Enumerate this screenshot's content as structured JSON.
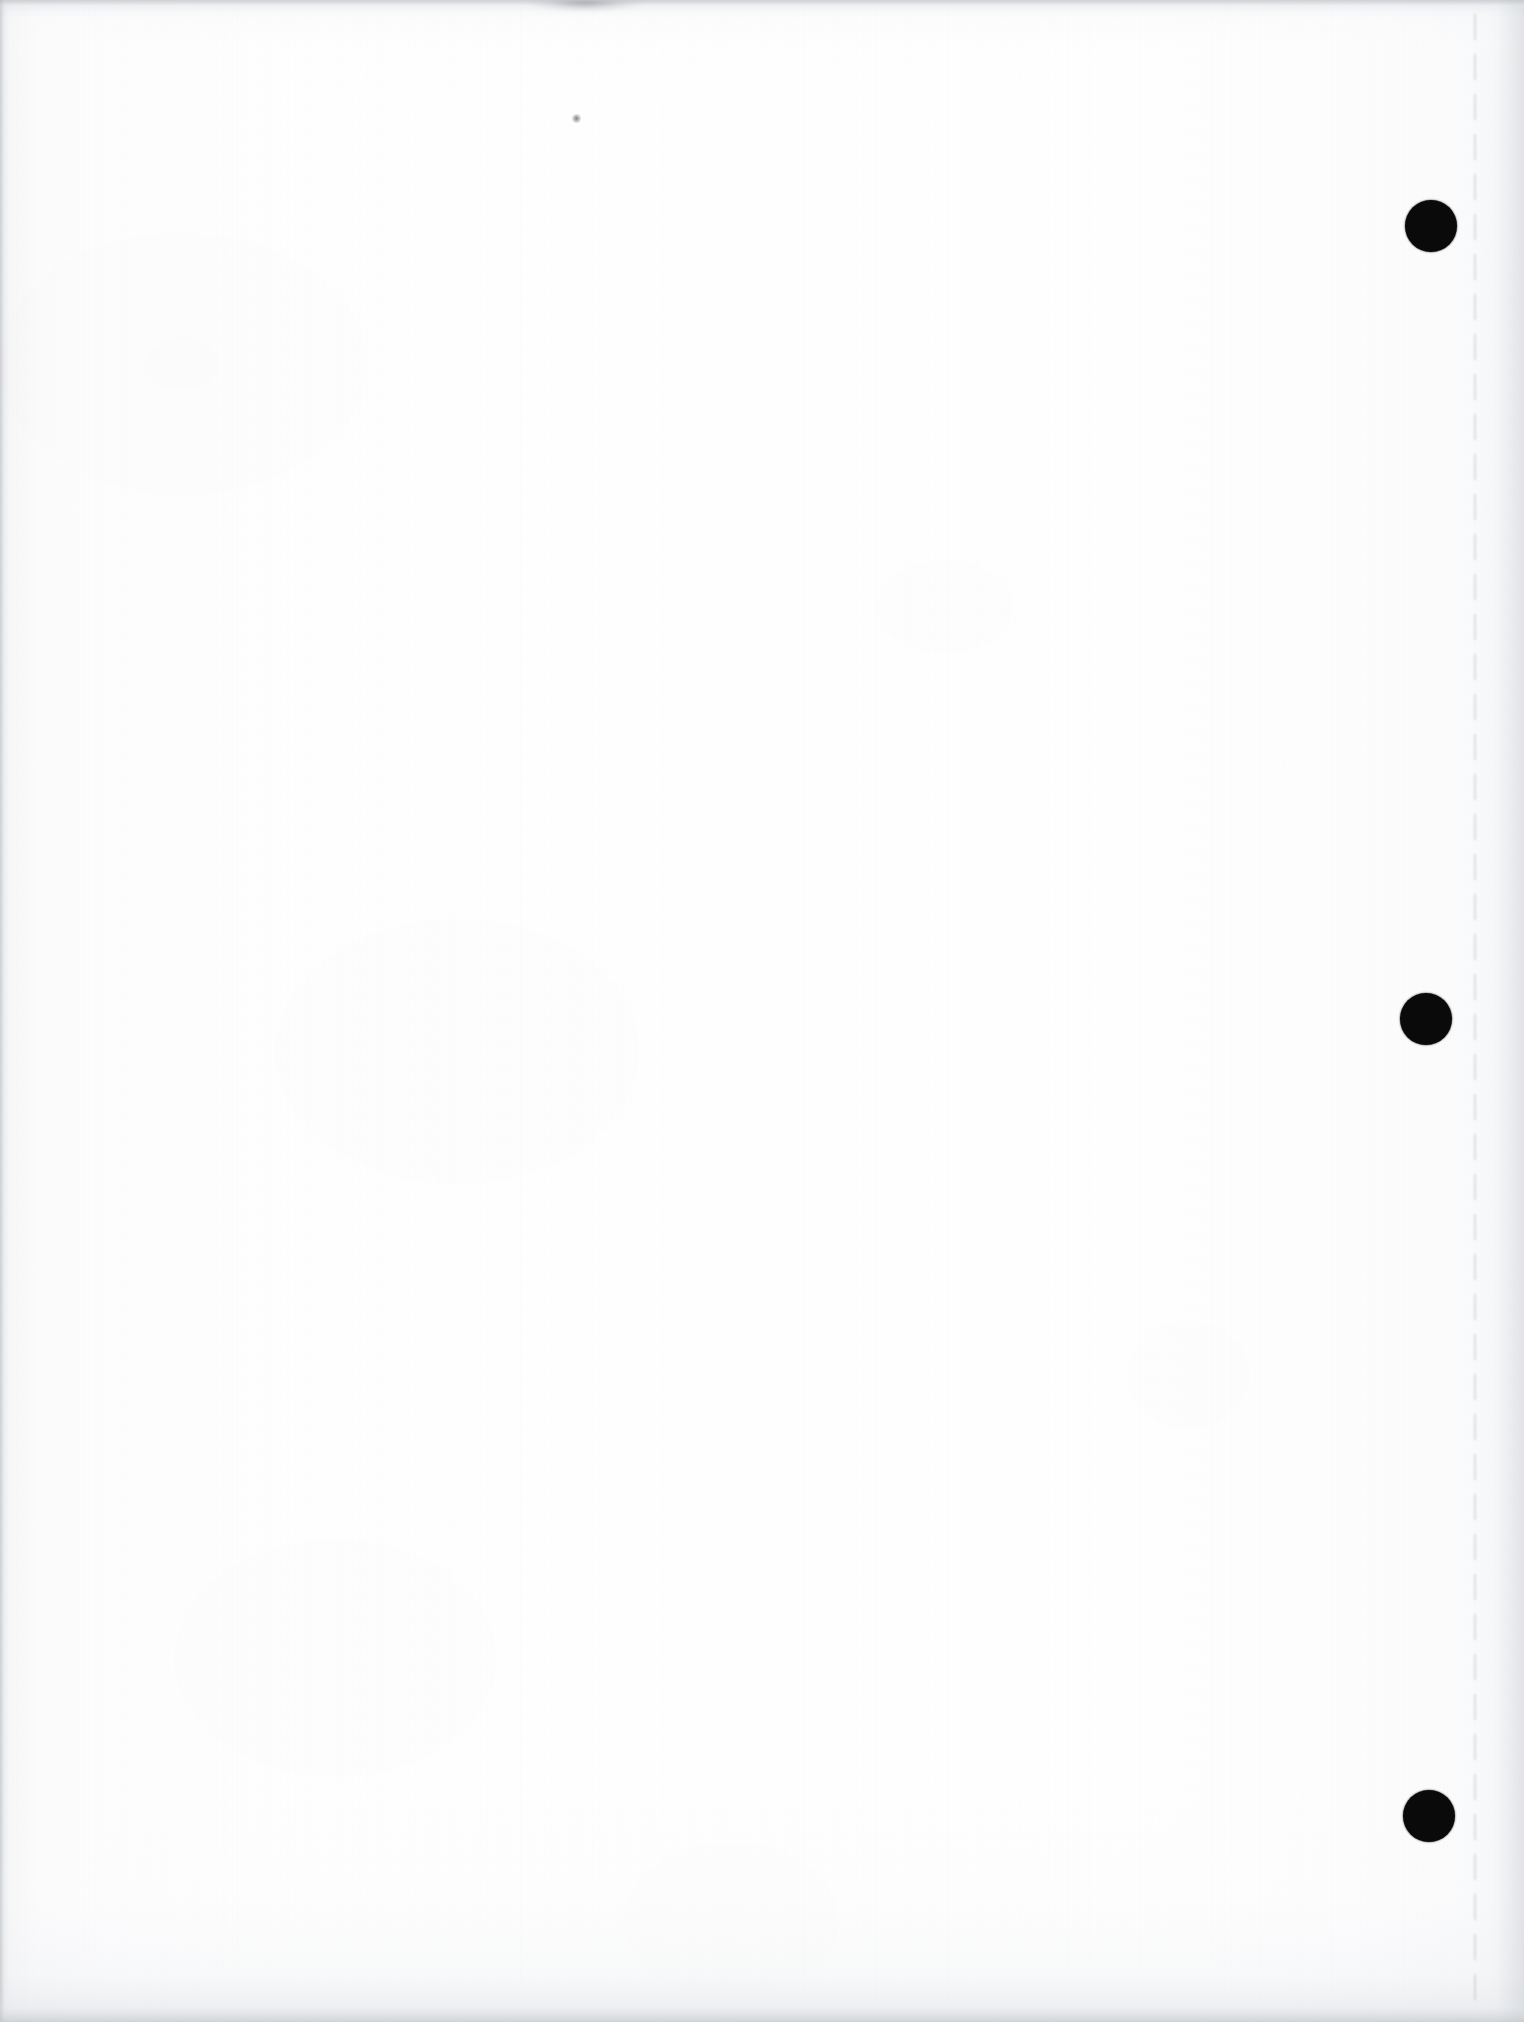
{
  "document": {
    "page_kind": "blank-scanned-page",
    "visible_text": "",
    "page_width_px": 1524,
    "page_height_px": 2022
  },
  "colors": {
    "paper": "#fefefe",
    "paper_edge_shadow": "#eff0f1",
    "mark_black": "#0a0a0a",
    "crease_gray": "#969ba3",
    "smudge_gray": "#787d84"
  },
  "marks": {
    "registration_dots": [
      {
        "label": "",
        "cx": 1431,
        "cy": 226,
        "d": 52
      },
      {
        "label": "",
        "cx": 1426,
        "cy": 1019,
        "d": 52
      },
      {
        "label": "",
        "cx": 1429,
        "cy": 1816,
        "d": 52
      }
    ],
    "specks": [
      {
        "label": "",
        "cx": 576,
        "cy": 118
      }
    ],
    "crease_line": {
      "label": "",
      "x": 1474,
      "top": 14,
      "height": 2000
    },
    "top_smudge": {
      "label": "",
      "x": 520,
      "y": 0,
      "w": 130,
      "h": 16
    }
  }
}
